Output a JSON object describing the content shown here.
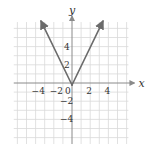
{
  "chart_data": {
    "type": "line",
    "title": "",
    "xlabel": "x",
    "ylabel": "y",
    "xlim": [
      -6.4,
      6.2
    ],
    "ylim": [
      -6.8,
      6.7
    ],
    "grid": true,
    "grid_step": 1,
    "x_ticks": [
      {
        "value": -4,
        "label": "−4"
      },
      {
        "value": -2,
        "label": "−2"
      },
      {
        "value": 0,
        "label": "0"
      },
      {
        "value": 2,
        "label": "2"
      },
      {
        "value": 4,
        "label": "4"
      }
    ],
    "y_ticks": [
      {
        "value": 4,
        "label": "4"
      },
      {
        "value": 2,
        "label": "2"
      },
      {
        "value": -2,
        "label": "−2"
      },
      {
        "value": -4,
        "label": "−4"
      }
    ],
    "series": [
      {
        "name": "y = 2|x|",
        "points": [
          [
            -3.4,
            6.8
          ],
          [
            0,
            0
          ],
          [
            3.4,
            6.8
          ]
        ],
        "arrows": "both-ends",
        "color": "#6b6b6b"
      }
    ],
    "colors": {
      "grid": "#d9d9d9",
      "axis": "#8a8a8a",
      "text": "#333333"
    }
  }
}
